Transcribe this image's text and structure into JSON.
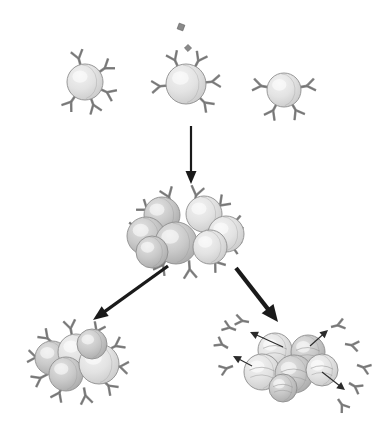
{
  "figure": {
    "background_color": "#ffffff",
    "width": 392,
    "height": 422
  },
  "palette": {
    "cell_fill_light": "#e3e3e3",
    "cell_fill_mid": "#c9c9c9",
    "cell_fill_dark": "#a9a9a9",
    "cell_outline": "#8f8f8f",
    "cell_highlight": "#f2f2f2",
    "receptor_fill": "#8a8a8a",
    "receptor_outline": "#5e5e5e",
    "antigen_fill": "#8a8a8a",
    "arrow_color": "#1a1a1a",
    "secretion_arrow_color": "#2b2b2b"
  },
  "stages": {
    "top_row": {
      "name": "naive-lymphocyte-row",
      "label": "Naive lymphocytes with distinct surface receptors",
      "cells": [
        {
          "id": "naive-cell-left",
          "label": "Naive lymphocyte (non-matching receptor)",
          "cx": 85,
          "cy": 82,
          "r": 18,
          "receptor_count": 5,
          "antigen_bound": false,
          "receptor_angles": [
            -105,
            -35,
            25,
            70,
            125
          ]
        },
        {
          "id": "naive-cell-center",
          "label": "Naive lymphocyte with matching receptor binding antigen",
          "cx": 186,
          "cy": 84,
          "r": 20,
          "receptor_count": 5,
          "antigen_bound": true,
          "receptor_angles": [
            -115,
            -62,
            -5,
            45,
            175
          ]
        },
        {
          "id": "naive-cell-right",
          "label": "Naive lymphocyte (non-matching receptor)",
          "cx": 284,
          "cy": 90,
          "r": 17,
          "receptor_count": 4,
          "antigen_bound": false,
          "receptor_angles": [
            -170,
            -10,
            60,
            118
          ]
        }
      ],
      "antigens": [
        {
          "id": "antigen-upper",
          "label": "free antigen particle",
          "x": 181,
          "y": 27,
          "size": 6,
          "rotation": 20
        },
        {
          "id": "antigen-lower",
          "label": "free antigen particle",
          "x": 188,
          "y": 48,
          "size": 5,
          "rotation": 45
        }
      ]
    },
    "proliferation_arrow": {
      "id": "proliferation-arrow",
      "label": "Activation and clonal proliferation",
      "x1": 191,
      "y1": 126,
      "x2": 191,
      "y2": 184,
      "stroke_width": 2.2,
      "head_width": 11,
      "head_length": 13
    },
    "clone_cluster": {
      "id": "clone-cluster",
      "label": "Proliferating clone of activated lymphocytes",
      "cx": 186,
      "cy": 232,
      "cell_count": 7,
      "receptor_count": 11,
      "cells": [
        {
          "cx": 162,
          "cy": 215,
          "r": 18
        },
        {
          "cx": 204,
          "cy": 214,
          "r": 18
        },
        {
          "cx": 146,
          "cy": 236,
          "r": 19
        },
        {
          "cx": 226,
          "cy": 234,
          "r": 18
        },
        {
          "cx": 176,
          "cy": 243,
          "r": 21
        },
        {
          "cx": 210,
          "cy": 247,
          "r": 17
        },
        {
          "cx": 152,
          "cy": 252,
          "r": 16
        }
      ]
    },
    "branch_arrow_left": {
      "id": "memory-branch-arrow",
      "label": "Differentiation into memory cells",
      "x1": 168,
      "y1": 266,
      "x2": 93,
      "y2": 320,
      "stroke_width": 3.2,
      "head_width": 12,
      "head_length": 15
    },
    "branch_arrow_right": {
      "id": "plasma-branch-arrow",
      "label": "Differentiation into antibody-secreting plasma cells",
      "x1": 236,
      "y1": 268,
      "x2": 278,
      "y2": 322,
      "stroke_width": 4.2,
      "head_width": 15,
      "head_length": 17
    },
    "memory_cluster": {
      "id": "memory-cell-cluster",
      "label": "Memory cells retaining surface receptors",
      "cx": 78,
      "cy": 362,
      "cell_count": 5,
      "receptor_count": 10,
      "cells": [
        {
          "cx": 52,
          "cy": 358,
          "r": 17
        },
        {
          "cx": 76,
          "cy": 352,
          "r": 18
        },
        {
          "cx": 66,
          "cy": 374,
          "r": 17
        },
        {
          "cx": 99,
          "cy": 364,
          "r": 20
        },
        {
          "cx": 92,
          "cy": 344,
          "r": 15
        }
      ]
    },
    "plasma_cluster": {
      "id": "plasma-cell-cluster",
      "label": "Plasma cells secreting free antibodies",
      "cx": 292,
      "cy": 365,
      "cell_count": 6,
      "secreted_antibody_count": 9,
      "secretion_arrow_count": 4,
      "cells": [
        {
          "cx": 275,
          "cy": 350,
          "r": 17
        },
        {
          "cx": 308,
          "cy": 352,
          "r": 17
        },
        {
          "cx": 262,
          "cy": 372,
          "r": 18
        },
        {
          "cx": 294,
          "cy": 374,
          "r": 19
        },
        {
          "cx": 322,
          "cy": 370,
          "r": 16
        },
        {
          "cx": 283,
          "cy": 388,
          "r": 14
        }
      ],
      "secretion_arrows": [
        {
          "x1": 283,
          "y1": 347,
          "x2": 250,
          "y2": 332
        },
        {
          "x1": 252,
          "y1": 366,
          "x2": 233,
          "y2": 356
        },
        {
          "x1": 310,
          "y1": 346,
          "x2": 328,
          "y2": 330
        },
        {
          "x1": 322,
          "y1": 372,
          "x2": 345,
          "y2": 390
        }
      ]
    }
  },
  "legend": {
    "cell_name": "lymphocyte",
    "receptor_name": "antibody-receptor",
    "antigen_name": "antigen"
  }
}
